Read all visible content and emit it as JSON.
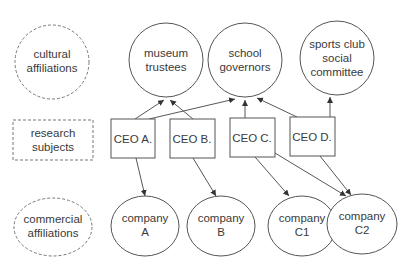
{
  "diagram": {
    "categories": {
      "cultural": {
        "lines": [
          "cultural",
          "affiliations"
        ]
      },
      "research": {
        "lines": [
          "research",
          "subjects"
        ]
      },
      "commercial": {
        "lines": [
          "commercial",
          "affiliations"
        ]
      }
    },
    "cultural_nodes": [
      {
        "id": "museum",
        "lines": [
          "museum",
          "trustees"
        ]
      },
      {
        "id": "school",
        "lines": [
          "school",
          "governors"
        ]
      },
      {
        "id": "sports",
        "lines": [
          "sports club",
          "social",
          "committee"
        ]
      }
    ],
    "ceo_nodes": [
      {
        "id": "ceo_a",
        "label": "CEO A."
      },
      {
        "id": "ceo_b",
        "label": "CEO B."
      },
      {
        "id": "ceo_c",
        "label": "CEO C."
      },
      {
        "id": "ceo_d",
        "label": "CEO D."
      }
    ],
    "company_nodes": [
      {
        "id": "company_a",
        "lines": [
          "company",
          "A"
        ]
      },
      {
        "id": "company_b",
        "lines": [
          "company",
          "B"
        ]
      },
      {
        "id": "company_c1",
        "lines": [
          "company",
          "C1"
        ]
      },
      {
        "id": "company_c2",
        "lines": [
          "company",
          "C2"
        ]
      }
    ],
    "edges": [
      {
        "from": "CEO A.",
        "to": "museum trustees"
      },
      {
        "from": "CEO A.",
        "to": "school governors"
      },
      {
        "from": "CEO B.",
        "to": "museum trustees"
      },
      {
        "from": "CEO C.",
        "to": "school governors"
      },
      {
        "from": "CEO D.",
        "to": "school governors"
      },
      {
        "from": "CEO D.",
        "to": "sports club social committee"
      },
      {
        "from": "CEO A.",
        "to": "company A"
      },
      {
        "from": "CEO B.",
        "to": "company B"
      },
      {
        "from": "CEO C.",
        "to": "company C1"
      },
      {
        "from": "CEO C.",
        "to": "company C2"
      },
      {
        "from": "CEO D.",
        "to": "company C2"
      }
    ],
    "colors": {
      "stroke": "#555555",
      "text": "#3a3a3a",
      "background": "#ffffff"
    }
  }
}
